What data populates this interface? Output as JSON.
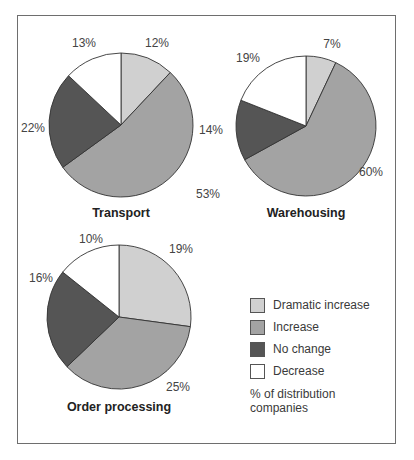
{
  "chart_data": [
    {
      "type": "pie",
      "title": "Transport",
      "categories": [
        "Dramatic increase",
        "Increase",
        "No change",
        "Decrease"
      ],
      "values": [
        12,
        53,
        22,
        13
      ],
      "labels": [
        "12%",
        "53%",
        "22%",
        "13%"
      ]
    },
    {
      "type": "pie",
      "title": "Warehousing",
      "categories": [
        "Dramatic increase",
        "Increase",
        "No change",
        "Decrease"
      ],
      "values": [
        7,
        60,
        14,
        19
      ],
      "labels": [
        "7%",
        "60%",
        "14%",
        "19%"
      ]
    },
    {
      "type": "pie",
      "title": "Order processing",
      "categories": [
        "Dramatic increase",
        "Increase",
        "No change",
        "Decrease"
      ],
      "values": [
        19,
        25,
        16,
        10
      ],
      "labels": [
        "19%",
        "25%",
        "16%",
        "10%"
      ]
    }
  ],
  "legend": {
    "items": [
      {
        "label": "Dramatic increase",
        "color": "#d0d0d0"
      },
      {
        "label": "Increase",
        "color": "#a3a3a3"
      },
      {
        "label": "No change",
        "color": "#555555"
      },
      {
        "label": "Decrease",
        "color": "#ffffff"
      }
    ],
    "note": "% of distribution companies"
  },
  "colors": {
    "dramatic_increase": "#d0d0d0",
    "increase": "#a3a3a3",
    "no_change": "#555555",
    "decrease": "#ffffff",
    "stroke": "#333333"
  },
  "pies": [
    {
      "cx": 121,
      "cy": 125,
      "r": 72,
      "title_x": 121,
      "title_y": 217,
      "label_pos": [
        [
          157,
          47
        ],
        [
          208,
          198
        ],
        [
          33,
          132
        ],
        [
          84,
          47
        ]
      ]
    },
    {
      "cx": 306,
      "cy": 126,
      "r": 70,
      "title_x": 306,
      "title_y": 217,
      "label_pos": [
        [
          332,
          48
        ],
        [
          371,
          176
        ],
        [
          211,
          134
        ],
        [
          248,
          62
        ]
      ]
    },
    {
      "cx": 119,
      "cy": 317,
      "r": 72,
      "title_x": 119,
      "title_y": 411,
      "label_pos": [
        [
          181,
          253
        ],
        [
          178,
          391
        ],
        [
          41,
          282
        ],
        [
          91,
          243
        ]
      ]
    }
  ]
}
